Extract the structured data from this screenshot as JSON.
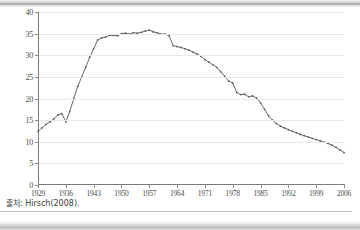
{
  "figure": {
    "source_note": "출처: Hirsch(2008)."
  },
  "chart_data": {
    "type": "line",
    "title": "",
    "xlabel": "",
    "ylabel": "",
    "xlim": [
      1929,
      2006
    ],
    "ylim": [
      0,
      40
    ],
    "grid": true,
    "legend": false,
    "marker": "dot",
    "line_color": "#555555",
    "y_ticks": [
      0,
      5,
      10,
      15,
      20,
      25,
      30,
      35,
      40
    ],
    "x_ticks": [
      1929,
      1936,
      1943,
      1950,
      1957,
      1964,
      1971,
      1978,
      1985,
      1992,
      1999,
      2006
    ],
    "y_tick_labels": [
      "0",
      "5",
      "10",
      "15",
      "20",
      "25",
      "30",
      "35",
      "40"
    ],
    "x_tick_labels": [
      "1929",
      "1936",
      "1943",
      "1950",
      "1957",
      "1964",
      "1971",
      "1978",
      "1985",
      "1992",
      "1999",
      "2006"
    ],
    "x": [
      1929,
      1930,
      1931,
      1932,
      1933,
      1934,
      1935,
      1936,
      1937,
      1938,
      1939,
      1940,
      1941,
      1942,
      1943,
      1944,
      1945,
      1946,
      1947,
      1948,
      1949,
      1950,
      1951,
      1952,
      1953,
      1954,
      1955,
      1956,
      1957,
      1958,
      1959,
      1960,
      1961,
      1962,
      1963,
      1964,
      1965,
      1966,
      1967,
      1968,
      1969,
      1970,
      1971,
      1972,
      1973,
      1974,
      1975,
      1976,
      1977,
      1978,
      1979,
      1980,
      1981,
      1982,
      1983,
      1984,
      1985,
      1986,
      1987,
      1988,
      1989,
      1990,
      1991,
      1992,
      1993,
      1994,
      1995,
      1996,
      1997,
      1998,
      1999,
      2000,
      2001,
      2002,
      2003,
      2004,
      2005,
      2006
    ],
    "values": [
      12.4,
      13.2,
      14.0,
      14.6,
      15.3,
      16.2,
      16.5,
      14.6,
      17.0,
      20.0,
      22.8,
      25.0,
      27.2,
      29.5,
      31.5,
      33.5,
      34.0,
      34.2,
      34.6,
      34.6,
      34.5,
      35.0,
      35.1,
      34.9,
      35.2,
      35.1,
      35.3,
      35.6,
      35.8,
      35.4,
      35.2,
      34.9,
      34.9,
      34.5,
      32.2,
      32.0,
      31.8,
      31.5,
      31.2,
      30.7,
      30.3,
      29.8,
      29.0,
      28.4,
      27.8,
      27.2,
      26.2,
      25.1,
      24.0,
      23.6,
      21.4,
      20.9,
      21.0,
      20.4,
      20.6,
      20.1,
      19.8,
      18.3,
      17.1,
      16.8,
      16.4,
      16.1,
      16.0,
      15.8,
      15.5,
      15.2,
      14.9,
      14.5,
      14.2,
      13.9,
      13.6,
      13.3,
      13.2,
      13.0,
      12.6,
      12.2,
      12.0,
      11.8
    ],
    "y_compressed_tail": [
      12.4,
      13.2,
      14.0,
      14.6,
      15.3,
      16.2,
      16.5,
      14.6,
      17.0,
      20.0,
      22.8,
      25.0,
      27.2,
      29.5,
      31.5,
      33.5,
      34.0,
      34.2,
      34.6,
      34.6,
      34.5,
      35.0,
      35.1,
      34.9,
      35.2,
      35.1,
      35.3,
      35.6,
      35.8,
      35.4,
      35.2,
      34.9,
      34.9,
      34.5,
      32.2,
      32.0,
      31.8,
      31.5,
      31.2,
      30.7,
      30.3,
      29.8,
      29.0,
      28.4,
      27.8,
      27.2,
      26.2,
      25.1,
      24.0,
      23.6,
      21.4,
      20.9,
      21.0,
      20.4,
      20.6,
      20.1,
      19.0,
      17.5,
      16.0,
      15.0,
      14.2,
      13.6,
      13.2,
      12.8,
      12.4,
      12.1,
      11.7,
      11.4,
      11.1,
      10.8,
      10.5,
      10.2,
      9.9,
      9.6,
      9.2,
      8.7,
      8.1,
      7.5
    ]
  }
}
